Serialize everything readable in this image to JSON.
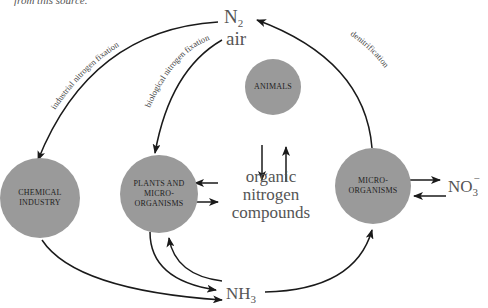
{
  "caption": "from this source.",
  "nodes": {
    "chemical_industry": "CHEMICAL INDUSTRY",
    "plants": "PLANTS AND MICRO-ORGANISMS",
    "animals": "ANIMALS",
    "microorganisms": "MICRO-ORGANISMS"
  },
  "labels": {
    "n2": "N",
    "n2_sub": "2",
    "air": "air",
    "organic": "organic",
    "nitrogen": "nitrogen",
    "compounds": "compounds",
    "nh3": "NH",
    "nh3_sub": "3",
    "no3": "NO",
    "no3_sub": "3",
    "no3_sup": "−"
  },
  "arrows": {
    "industrial": "industrial nitrogen fixation",
    "biological": "biological nitrogen fixation",
    "denitrification": "denitrification"
  },
  "colors": {
    "node_fill": "#9a9a9a",
    "line": "#1a1a1a"
  }
}
